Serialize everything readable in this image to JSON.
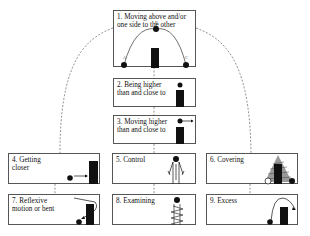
{
  "diagram": {
    "type": "hierarchy",
    "nodes": [
      {
        "id": "1",
        "label": "1. Moving above and/or\none side to the other",
        "arc_point_labels": [
          "A",
          "B",
          "C"
        ]
      },
      {
        "id": "2",
        "label": "2. Being higher\nthan and close to"
      },
      {
        "id": "3",
        "label": "3. Moving higher\nthan and close to"
      },
      {
        "id": "4",
        "label": "4. Getting\ncloser"
      },
      {
        "id": "5",
        "label": "5. Control"
      },
      {
        "id": "6",
        "label": "6. Covering"
      },
      {
        "id": "7",
        "label": "7. Reflexive\nmotion or bent"
      },
      {
        "id": "8",
        "label": "8. Examining"
      },
      {
        "id": "9",
        "label": "9. Excess"
      }
    ],
    "edges": [
      {
        "from": "1",
        "to": "2",
        "style": "dashed"
      },
      {
        "from": "2",
        "to": "3",
        "style": "dashed"
      },
      {
        "from": "3",
        "to": "5",
        "style": "dashed"
      },
      {
        "from": "1",
        "to": "4",
        "style": "dashed-curve"
      },
      {
        "from": "1",
        "to": "6",
        "style": "dashed-curve"
      },
      {
        "from": "4",
        "to": "7",
        "style": "dashed"
      },
      {
        "from": "5",
        "to": "8",
        "style": "dashed"
      },
      {
        "from": "6",
        "to": "9",
        "style": "dashed"
      }
    ],
    "colors": {
      "border": "#555555",
      "figure": "#111111",
      "dash": "#777777"
    }
  }
}
